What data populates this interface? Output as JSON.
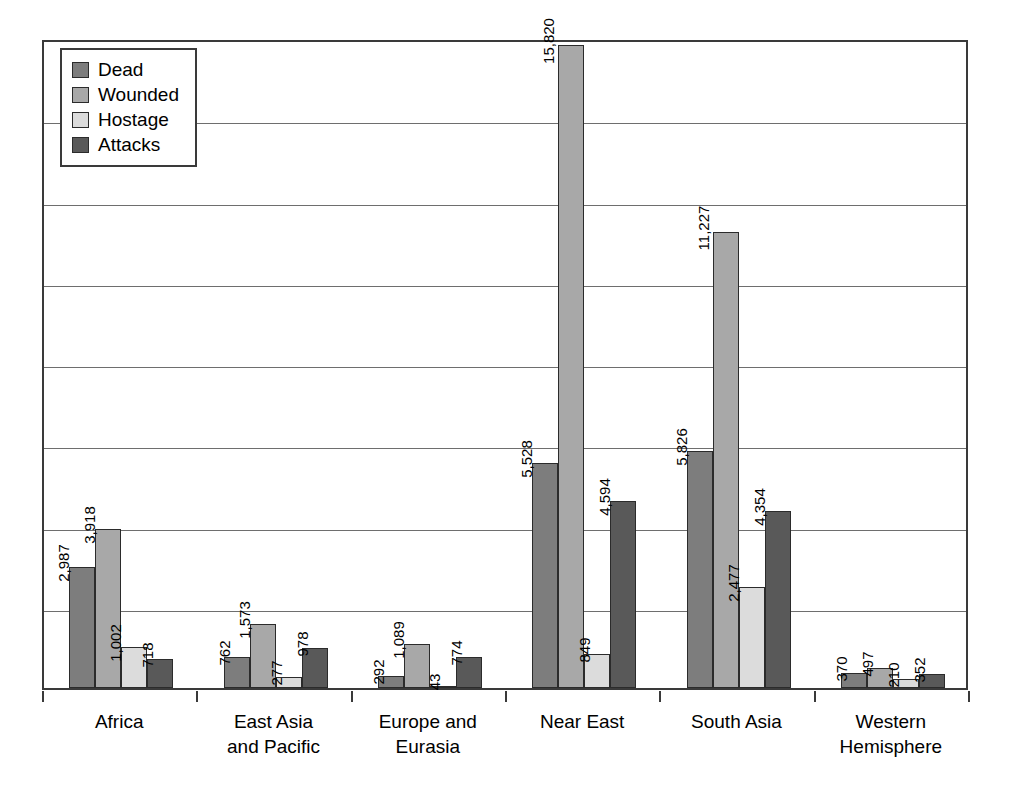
{
  "chart_data": {
    "type": "bar",
    "title": "",
    "subtitle": "",
    "xlabel": "",
    "ylabel": "",
    "ylim": [
      0,
      16000
    ],
    "y_tick_interval": 2000,
    "y_tick_labels_visible": false,
    "grid": true,
    "legend_position": "top-left",
    "categories": [
      "Africa",
      "East Asia\nand Pacific",
      "Europe and\nEurasia",
      "Near East",
      "South Asia",
      "Western\nHemisphere"
    ],
    "series": [
      {
        "name": "Dead",
        "color": "#7d7d7d",
        "values": [
          2987,
          762,
          292,
          5528,
          5826,
          370
        ],
        "labels": [
          "2,987",
          "762",
          "292",
          "5,528",
          "5,826",
          "370"
        ]
      },
      {
        "name": "Wounded",
        "color": "#a8a8a8",
        "values": [
          3918,
          1573,
          1089,
          15820,
          11227,
          497
        ],
        "labels": [
          "3,918",
          "1,573",
          "1,089",
          "15,820",
          "11,227",
          "497"
        ]
      },
      {
        "name": "Hostage",
        "color": "#dcdcdc",
        "values": [
          1002,
          277,
          43,
          849,
          2477,
          210
        ],
        "labels": [
          "1,002",
          "277",
          "43",
          "849",
          "2,477",
          "210"
        ]
      },
      {
        "name": "Attacks",
        "color": "#595959",
        "values": [
          718,
          978,
          774,
          4594,
          4354,
          352
        ],
        "labels": [
          "718",
          "978",
          "774",
          "4,594",
          "4,354",
          "352"
        ]
      }
    ]
  },
  "legend": {
    "items": [
      {
        "label": "Dead",
        "color": "#7d7d7d"
      },
      {
        "label": "Wounded",
        "color": "#a8a8a8"
      },
      {
        "label": "Hostage",
        "color": "#dcdcdc"
      },
      {
        "label": "Attacks",
        "color": "#595959"
      }
    ]
  }
}
